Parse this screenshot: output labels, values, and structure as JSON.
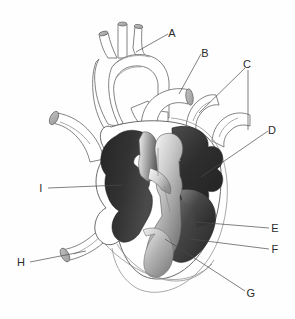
{
  "figure": {
    "kind": "anatomical-diagram",
    "background_color": "#fefefe",
    "line_color": "#5a5a5a",
    "label_color": "#2b2b2b",
    "chamber_dark_color": "#2f2f2f",
    "chamber_mid_color": "#6a6a6a",
    "chamber_light_color": "#cfcfcf",
    "vessel_fill_color": "#ffffff",
    "cut_end_color": "#a9a9a9"
  },
  "labels": [
    {
      "id": "A",
      "text": "A",
      "x": 172,
      "y": 33
    },
    {
      "id": "B",
      "text": "B",
      "x": 205,
      "y": 53
    },
    {
      "id": "C",
      "text": "C",
      "x": 247,
      "y": 64
    },
    {
      "id": "D",
      "text": "D",
      "x": 272,
      "y": 130
    },
    {
      "id": "E",
      "text": "E",
      "x": 274,
      "y": 229
    },
    {
      "id": "F",
      "text": "F",
      "x": 274,
      "y": 250
    },
    {
      "id": "G",
      "text": "G",
      "x": 250,
      "y": 294
    },
    {
      "id": "H",
      "text": "H",
      "x": 20,
      "y": 265
    },
    {
      "id": "I",
      "text": "I",
      "x": 40,
      "y": 190
    }
  ],
  "structures": [
    {
      "name": "aortic-arch"
    },
    {
      "name": "brachiocephalic-artery"
    },
    {
      "name": "left-common-carotid-artery"
    },
    {
      "name": "left-subclavian-artery"
    },
    {
      "name": "pulmonary-artery"
    },
    {
      "name": "pulmonary-veins"
    },
    {
      "name": "superior-vena-cava"
    },
    {
      "name": "inferior-vena-cava"
    },
    {
      "name": "right-atrium"
    },
    {
      "name": "left-atrium"
    },
    {
      "name": "right-ventricle"
    },
    {
      "name": "left-ventricle"
    },
    {
      "name": "interventricular-septum"
    },
    {
      "name": "atrioventricular-valve"
    },
    {
      "name": "myocardium-wall"
    },
    {
      "name": "apex"
    }
  ]
}
